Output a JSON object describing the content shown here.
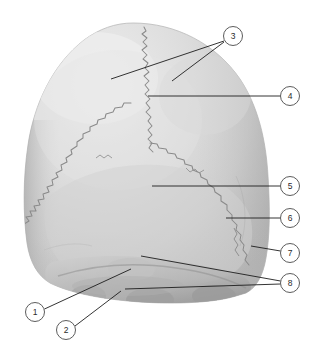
{
  "figure": {
    "title": "Skull, posterior view",
    "background_color": "#ffffff",
    "width": 325,
    "height": 363
  },
  "specimen": {
    "name": "skull-posterior",
    "bone_fill_light": "#dcdcdc",
    "bone_fill_mid": "#cfcfcf",
    "bone_fill_shadow": "#a6a6a6",
    "bone_fill_deep_shadow": "#8d8d8d",
    "highlight": "#ededed",
    "outline_color": "#b4b4b4",
    "suture_color": "#8a8a8a"
  },
  "sutures": [
    {
      "name": "sagittal-suture",
      "label_ref": "4"
    },
    {
      "name": "lambdoid-suture",
      "label_ref": "6"
    }
  ],
  "leader": {
    "color": "#1d1d1d",
    "width": 0.9,
    "circle_radius": 9.5,
    "circle_stroke": "#4a4a4a",
    "circle_fill": "#ffffff",
    "number_color": "#2b2b2b",
    "number_font_size": 8.5
  },
  "callouts": [
    {
      "id": "1",
      "label": "1",
      "circle": {
        "cx": 35,
        "cy": 312,
        "r": 9.5
      },
      "lines": [
        {
          "x1": 44.5,
          "y1": 309,
          "x2": 131,
          "y2": 269
        }
      ]
    },
    {
      "id": "2",
      "label": "2",
      "circle": {
        "cx": 66,
        "cy": 330,
        "r": 9.5
      },
      "lines": [
        {
          "x1": 75,
          "y1": 326,
          "x2": 121,
          "y2": 291
        }
      ]
    },
    {
      "id": "3",
      "label": "3",
      "circle": {
        "cx": 233,
        "cy": 36,
        "r": 9.5
      },
      "lines": [
        {
          "x1": 224,
          "y1": 41,
          "x2": 111,
          "y2": 79
        },
        {
          "x1": 224,
          "y1": 42,
          "x2": 172,
          "y2": 81
        }
      ]
    },
    {
      "id": "4",
      "label": "4",
      "circle": {
        "cx": 290,
        "cy": 96,
        "r": 9.5
      },
      "lines": [
        {
          "x1": 280.5,
          "y1": 96,
          "x2": 148,
          "y2": 96
        }
      ]
    },
    {
      "id": "5",
      "label": "5",
      "circle": {
        "cx": 290,
        "cy": 186,
        "r": 9.5
      },
      "lines": [
        {
          "x1": 280.5,
          "y1": 186,
          "x2": 152,
          "y2": 186
        }
      ]
    },
    {
      "id": "6",
      "label": "6",
      "circle": {
        "cx": 290,
        "cy": 218,
        "r": 9.5
      },
      "lines": [
        {
          "x1": 280.5,
          "y1": 218,
          "x2": 226,
          "y2": 218
        }
      ]
    },
    {
      "id": "7",
      "label": "7",
      "circle": {
        "cx": 290,
        "cy": 253,
        "r": 9.5
      },
      "lines": [
        {
          "x1": 280.5,
          "y1": 251,
          "x2": 251,
          "y2": 246
        }
      ]
    },
    {
      "id": "8",
      "label": "8",
      "circle": {
        "cx": 290,
        "cy": 283,
        "r": 9.5
      },
      "lines": [
        {
          "x1": 280.5,
          "y1": 281,
          "x2": 141,
          "y2": 256
        },
        {
          "x1": 280.5,
          "y1": 284,
          "x2": 125,
          "y2": 289
        }
      ]
    }
  ]
}
